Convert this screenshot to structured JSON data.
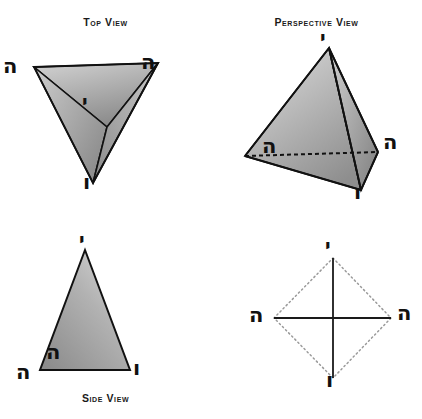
{
  "panels": {
    "top_view": {
      "title": "Top View",
      "letters": {
        "left": "ה",
        "right": "ה",
        "center": "י",
        "bottom": "ו"
      }
    },
    "perspective_view": {
      "title": "Perspective View",
      "letters": {
        "apex": "י",
        "left": "ה",
        "right": "ה",
        "front": "ו"
      }
    },
    "side_view": {
      "title": "Side View",
      "letters": {
        "apex": "י",
        "inner_left": "ה",
        "outer_left": "ה",
        "right": "ו"
      }
    },
    "axis_view": {
      "title": "",
      "letters": {
        "top": "י",
        "left": "ה",
        "right": "ה",
        "bottom": "ו"
      }
    }
  },
  "colors": {
    "stroke": "#111111",
    "face_light": "#d9d9d9",
    "face_mid": "#a8a8a8",
    "face_dark": "#8f8f8f",
    "face_darker": "#7d7d7d",
    "dotted": "#9a9a9a",
    "background": "#ffffff"
  }
}
